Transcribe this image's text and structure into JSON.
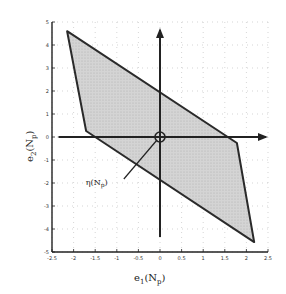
{
  "chart_data": {
    "type": "area",
    "title": "",
    "xlabel": "e_1(N_p)",
    "ylabel": "e_2(N_p)",
    "xlabel_main": "e",
    "xlabel_sub": "1",
    "xlabel_arg": "(N",
    "xlabel_arg_sub": "p",
    "xlabel_close": ")",
    "ylabel_main": "e",
    "ylabel_sub": "2",
    "ylabel_arg": "(N",
    "ylabel_arg_sub": "p",
    "ylabel_close": ")",
    "xlim": [
      -2.5,
      2.5
    ],
    "ylim": [
      -5,
      5
    ],
    "xticks": [
      -2.5,
      -2,
      -1.5,
      -1,
      -0.5,
      0,
      0.5,
      1,
      1.5,
      2,
      2.5
    ],
    "xtick_labels": [
      "-2.5",
      "-2",
      "-1.5",
      "-1",
      "-0.5",
      "0",
      "0.5",
      "1",
      "1.5",
      "2",
      "2.5"
    ],
    "yticks": [
      5,
      4,
      3,
      2,
      1,
      0,
      -1,
      -2,
      -3,
      -4,
      -5
    ],
    "ytick_labels": [
      "5",
      "4",
      "3",
      "2",
      "1",
      "0",
      "-1",
      "-2",
      "-3",
      "-4",
      "-5"
    ],
    "grid": true,
    "grid_style": "dotted",
    "polygon": {
      "name": "feasible error region",
      "fill": "#d4d4d4",
      "edge": "#2a2a2a",
      "vertices": [
        [
          -2.15,
          4.6
        ],
        [
          1.78,
          -0.26
        ],
        [
          2.18,
          -4.57
        ],
        [
          -1.71,
          0.26
        ]
      ]
    },
    "inner_axes": {
      "horizontal": {
        "from": [
          -2.35,
          0
        ],
        "to": [
          2.45,
          0
        ],
        "arrow": "right"
      },
      "vertical": {
        "from": [
          0,
          -4.35
        ],
        "to": [
          0,
          4.65
        ],
        "arrow": "up"
      }
    },
    "origin_marker": {
      "x": 0,
      "y": 0,
      "shape": "circle"
    },
    "annotation": {
      "text_main": "η(N",
      "text_sub": "p",
      "text_close": ")",
      "label_at": [
        -1.3,
        -2.0
      ],
      "arrow_to": [
        0,
        0
      ]
    }
  }
}
